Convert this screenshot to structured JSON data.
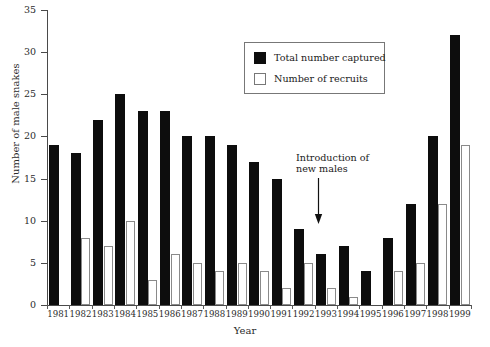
{
  "chart_data": {
    "type": "bar",
    "title": "",
    "xlabel": "Year",
    "ylabel": "Number of male snakes",
    "ylim": [
      0,
      35
    ],
    "yticks": [
      0,
      5,
      10,
      15,
      20,
      25,
      30,
      35
    ],
    "grid": false,
    "legend_position": "top-center-right",
    "categories": [
      "1981",
      "1982",
      "1983",
      "1984",
      "1985",
      "1986",
      "1987",
      "1988",
      "1989",
      "1990",
      "1991",
      "1992",
      "1993",
      "1994",
      "1995",
      "1996",
      "1997",
      "1998",
      "1999"
    ],
    "series": [
      {
        "name": "Total number captured",
        "color": "#0d0d0d",
        "values": [
          19,
          18,
          22,
          25,
          23,
          23,
          20,
          20,
          19,
          17,
          15,
          9,
          6,
          7,
          4,
          8,
          12,
          20,
          32
        ]
      },
      {
        "name": "Number of recruits",
        "color": "#ffffff",
        "values": [
          0,
          8,
          7,
          10,
          3,
          6,
          5,
          4,
          5,
          4,
          2,
          5,
          2,
          1,
          0,
          4,
          5,
          12,
          19
        ]
      }
    ],
    "annotations": [
      {
        "text": "Introduction of new males",
        "text_line1": "Introduction of",
        "text_line2": "new males",
        "points_to_category": "1992",
        "arrow": "down-arrow"
      }
    ]
  },
  "legend": {
    "items": [
      {
        "label": "Total number captured",
        "swatch": "filled-black-square"
      },
      {
        "label": "Number of recruits",
        "swatch": "outlined-white-square"
      }
    ]
  },
  "axes": {
    "y_title": "Number of male snakes",
    "x_title": "Year",
    "y_tick_labels": [
      "0",
      "5",
      "10",
      "15",
      "20",
      "25",
      "30",
      "35"
    ],
    "x_tick_labels": [
      "1981",
      "1982",
      "1983",
      "1984",
      "1985",
      "1986",
      "1987",
      "1988",
      "1989",
      "1990",
      "1991",
      "1992",
      "1993",
      "1994",
      "1995",
      "1996",
      "1997",
      "1998",
      "1999"
    ]
  }
}
